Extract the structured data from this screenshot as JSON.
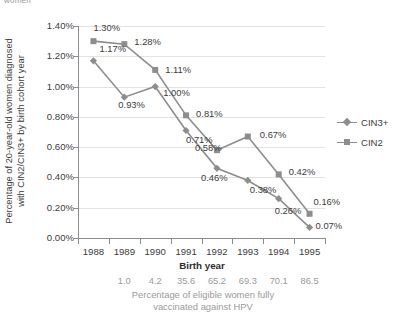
{
  "top_cut_text": "women",
  "chart_data": {
    "type": "line",
    "title": "",
    "xlabel": "Birth year",
    "ylabel_lines": [
      "Percentage of 20-year-old women diagnosed",
      "with CIN2/CIN3+ by birth cohort year"
    ],
    "ylabel": "Percentage of 20-year-old women diagnosed with CIN2/CIN3+ by birth cohort year",
    "categories": [
      "1988",
      "1989",
      "1990",
      "1991",
      "1992",
      "1993",
      "1994",
      "1995"
    ],
    "ylim": [
      0,
      1.4
    ],
    "yticks": [
      "0.00%",
      "0.20%",
      "0.40%",
      "0.60%",
      "0.80%",
      "1.00%",
      "1.20%",
      "1.40%"
    ],
    "ytick_values": [
      0,
      0.2,
      0.4,
      0.6,
      0.8,
      1.0,
      1.2,
      1.4
    ],
    "grid": true,
    "legend_position": "right",
    "series": [
      {
        "name": "CIN3+",
        "marker": "diamond",
        "color": "#8d8d8d",
        "values": [
          1.17,
          0.93,
          1.0,
          0.71,
          0.46,
          0.38,
          0.26,
          0.07
        ],
        "labels": [
          "1.17%",
          "0.93%",
          "1.00%",
          "0.71%",
          "0.46%",
          "0.38%",
          "0.26%",
          "0.07%"
        ]
      },
      {
        "name": "CIN2",
        "marker": "square",
        "color": "#8d8d8d",
        "values": [
          1.3,
          1.28,
          1.11,
          0.81,
          0.58,
          0.67,
          0.42,
          0.16
        ],
        "labels": [
          "1.30%",
          "1.28%",
          "1.11%",
          "0.81%",
          "0.58%",
          "0.67%",
          "0.42%",
          "0.16%"
        ]
      }
    ],
    "secondary_axis": {
      "title_lines": [
        "Percentage of eligible women fully",
        "vaccinated against HPV"
      ],
      "title": "Percentage of eligible women fully vaccinated against HPV",
      "categories": [
        "1988",
        "1989",
        "1990",
        "1991",
        "1992",
        "1993",
        "1994",
        "1995"
      ],
      "values": [
        "",
        "1.0",
        "4.2",
        "35.6",
        "65.2",
        "69.3",
        "70.1",
        "86.5"
      ]
    }
  },
  "legend": {
    "items": [
      {
        "label": "CIN3+"
      },
      {
        "label": "CIN2"
      }
    ]
  }
}
